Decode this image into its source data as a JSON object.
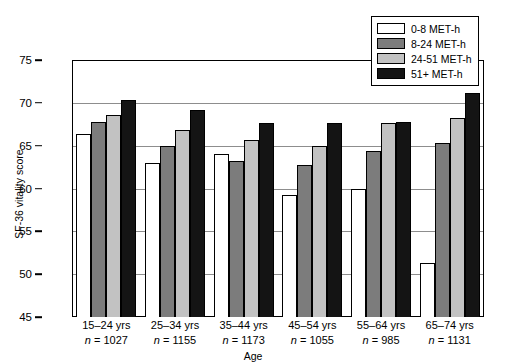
{
  "chart_data": {
    "type": "bar",
    "title": "",
    "xlabel": "Age",
    "ylabel": "SF-36 vitality score",
    "ylim": [
      45,
      75
    ],
    "yticks": [
      45,
      50,
      55,
      60,
      65,
      70,
      75
    ],
    "grid": true,
    "legend_position": "top-right",
    "categories": [
      "15–24 yrs",
      "25–34 yrs",
      "35–44 yrs",
      "45–54 yrs",
      "55–64 yrs",
      "65–74 yrs"
    ],
    "category_counts": [
      "n = 1027",
      "n = 1155",
      "n = 1173",
      "n = 1055",
      "n = 985",
      "n = 1131"
    ],
    "series": [
      {
        "name": "0-8 MET-h",
        "color": "#ffffff",
        "values": [
          66.4,
          63.0,
          64.0,
          59.2,
          59.9,
          51.3
        ]
      },
      {
        "name": "8-24 MET-h",
        "color": "#7c7c7c",
        "values": [
          67.8,
          65.0,
          63.2,
          62.8,
          64.4,
          65.3
        ]
      },
      {
        "name": "24-51 MET-h",
        "color": "#c2c2c2",
        "values": [
          68.6,
          66.8,
          65.7,
          65.0,
          67.6,
          68.2
        ]
      },
      {
        "name": "51+ MET-h",
        "color": "#141414",
        "values": [
          70.3,
          69.2,
          67.6,
          67.7,
          67.8,
          71.2
        ]
      }
    ]
  },
  "legend": {
    "items": [
      {
        "label": "0-8 MET-h"
      },
      {
        "label": "8-24 MET-h"
      },
      {
        "label": "24-51 MET-h"
      },
      {
        "label": "51+ MET-h"
      }
    ]
  },
  "axes": {
    "y_title": "SF-36 vitality score",
    "x_title": "Age",
    "y_tick_labels": [
      "75",
      "70",
      "65",
      "60",
      "55",
      "50",
      "45"
    ]
  }
}
